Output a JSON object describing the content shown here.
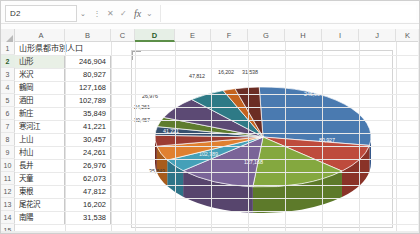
{
  "app": {
    "name": "spreadsheet",
    "accent_color": "#5c8f48"
  },
  "formula_bar": {
    "name_box_value": "D2",
    "namebox_chevron": "⌄",
    "more_icon": "⋮",
    "cancel_icon": "✕",
    "confirm_icon": "✓",
    "fx_icon": "fx",
    "fx_chevron": "⌄",
    "formula_value": ""
  },
  "sheet": {
    "columns": [
      {
        "label": "A",
        "left": 3,
        "width": 47,
        "selected": false
      },
      {
        "label": "B",
        "left": 50,
        "width": 46,
        "selected": false
      },
      {
        "label": "C",
        "left": 96,
        "width": 24,
        "selected": false
      },
      {
        "label": "D",
        "left": 120,
        "width": 40,
        "selected": true
      },
      {
        "label": "E",
        "left": 160,
        "width": 36,
        "selected": false
      },
      {
        "label": "F",
        "left": 196,
        "width": 37,
        "selected": false
      },
      {
        "label": "G",
        "left": 233,
        "width": 37,
        "selected": false
      },
      {
        "label": "H",
        "left": 270,
        "width": 37,
        "selected": false
      },
      {
        "label": "I",
        "left": 307,
        "width": 37,
        "selected": false
      },
      {
        "label": "J",
        "left": 344,
        "width": 37,
        "selected": false
      },
      {
        "label": "K",
        "left": 381,
        "width": 24,
        "selected": false
      }
    ],
    "rows": [
      {
        "num": "1",
        "selected": false
      },
      {
        "num": "2",
        "selected": true
      },
      {
        "num": "3",
        "selected": false
      },
      {
        "num": "4",
        "selected": false
      },
      {
        "num": "5",
        "selected": false
      },
      {
        "num": "6",
        "selected": false
      },
      {
        "num": "7",
        "selected": false
      },
      {
        "num": "8",
        "selected": false
      },
      {
        "num": "9",
        "selected": false
      },
      {
        "num": "10",
        "selected": false
      },
      {
        "num": "11",
        "selected": false
      },
      {
        "num": "12",
        "selected": false
      },
      {
        "num": "13",
        "selected": false
      },
      {
        "num": "14",
        "selected": false
      },
      {
        "num": "15",
        "selected": false
      }
    ],
    "title_cell": "山形県都市別人口",
    "data_rows": [
      {
        "name": "山形",
        "value": "246,904"
      },
      {
        "name": "米沢",
        "value": "80,927"
      },
      {
        "name": "鶴岡",
        "value": "127,168"
      },
      {
        "name": "酒田",
        "value": "102,789"
      },
      {
        "name": "新庄",
        "value": "35,849"
      },
      {
        "name": "寒河江",
        "value": "41,221"
      },
      {
        "name": "上山",
        "value": "30,457"
      },
      {
        "name": "村山",
        "value": "24,261"
      },
      {
        "name": "長井",
        "value": "26,976"
      },
      {
        "name": "天童",
        "value": "62,073"
      },
      {
        "name": "東根",
        "value": "47,812"
      },
      {
        "name": "尾花沢",
        "value": "16,202"
      },
      {
        "name": "南陽",
        "value": "31,538"
      }
    ]
  },
  "chart_data": {
    "type": "pie",
    "title": "",
    "three_d": true,
    "categories": [
      "山形",
      "米沢",
      "鶴岡",
      "酒田",
      "新庄",
      "寒河江",
      "上山",
      "村山",
      "長井",
      "天童",
      "東根",
      "尾花沢",
      "南陽"
    ],
    "values": [
      246904,
      80927,
      127168,
      102789,
      35849,
      41221,
      30457,
      24261,
      26976,
      62073,
      47812,
      16202,
      31538
    ],
    "value_labels": [
      "246,904",
      "80,927",
      "127,168",
      "102,789",
      "35,849",
      "41,221",
      "30,457",
      "24,261",
      "26,976",
      "62,073",
      "47,812",
      "16,202",
      "31,538"
    ],
    "colors": [
      "#4a7ab0",
      "#be4b3c",
      "#84a83f",
      "#7a6498",
      "#45a0b8",
      "#e08030",
      "#9c3c32",
      "#36506f",
      "#5e7c2e",
      "#5c4a74",
      "#2e7a86",
      "#c4631f",
      "#6b2d24"
    ],
    "side_colors": [
      "#35578a",
      "#8a3328",
      "#5d7a2a",
      "#57456d",
      "#2e7488",
      "#a85c1c",
      "#6e2820",
      "#253a52",
      "#415823",
      "#41345a",
      "#1f555e",
      "#8e4614",
      "#4b1f18"
    ],
    "legend": false,
    "data_labels_shown": true,
    "labels": [
      {
        "text": "246,904",
        "x": 172,
        "y": 40,
        "style": "inner"
      },
      {
        "text": "80,927",
        "x": 187,
        "y": 86,
        "style": "inner"
      },
      {
        "text": "127,168",
        "x": 112,
        "y": 108,
        "style": "inner"
      },
      {
        "text": "102,789",
        "x": 67,
        "y": 100,
        "style": "inner-dark"
      },
      {
        "text": "35,849",
        "x": 17,
        "y": 117,
        "style": "outer"
      },
      {
        "text": "41,221",
        "x": 31,
        "y": 77,
        "style": "inner"
      },
      {
        "text": "30,457",
        "x": 2,
        "y": 66,
        "style": "outer"
      },
      {
        "text": "24,261",
        "x": 2,
        "y": 53,
        "style": "outer"
      },
      {
        "text": "26,976",
        "x": 10,
        "y": 42,
        "style": "outer"
      },
      {
        "text": "47,812",
        "x": 57,
        "y": 22,
        "style": "outer"
      },
      {
        "text": "16,202",
        "x": 86,
        "y": 18,
        "style": "outer"
      },
      {
        "text": "31,538",
        "x": 110,
        "y": 18,
        "style": "outer"
      }
    ]
  }
}
